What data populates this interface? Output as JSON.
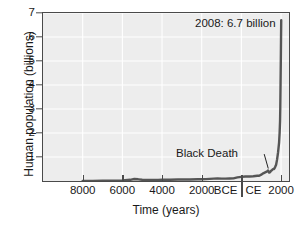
{
  "chart_data": {
    "type": "line",
    "title": "",
    "xlabel": "Time (years)",
    "ylabel": "Human population (billions)",
    "xlim": [
      -10000,
      2400
    ],
    "ylim": [
      0,
      7
    ],
    "grid": true,
    "legend": null,
    "y_ticks": [
      1,
      2,
      3,
      4,
      5,
      6,
      7
    ],
    "y_tick_labels": [
      "1",
      "2",
      "3",
      "4",
      "5",
      "6",
      "7"
    ],
    "x_ticks": [
      -8000,
      -6000,
      -4000,
      -2000,
      0,
      2000
    ],
    "x_tick_labels": [
      "8000",
      "6000",
      "4000",
      "2000",
      "",
      "2000"
    ],
    "era_labels": {
      "bce": "BCE",
      "ce": "CE",
      "divider_year": 0
    },
    "series": [
      {
        "name": "Human population",
        "color": "#555555",
        "x": [
          -8000,
          -7500,
          -7000,
          -6500,
          -6000,
          -5600,
          -5400,
          -5200,
          -5000,
          -4600,
          -4200,
          -4000,
          -3600,
          -3200,
          -3000,
          -2600,
          -2200,
          -2000,
          -1800,
          -1600,
          -1400,
          -1200,
          -1000,
          -800,
          -600,
          -400,
          -200,
          0,
          200,
          400,
          600,
          700,
          800,
          900,
          1000,
          1100,
          1200,
          1300,
          1340,
          1400,
          1450,
          1500,
          1550,
          1600,
          1650,
          1700,
          1750,
          1800,
          1850,
          1900,
          1927,
          1950,
          1960,
          1974,
          1987,
          1999,
          2008
        ],
        "y": [
          0.005,
          0.007,
          0.01,
          0.014,
          0.02,
          0.05,
          0.085,
          0.07,
          0.05,
          0.045,
          0.045,
          0.05,
          0.055,
          0.06,
          0.06,
          0.065,
          0.07,
          0.075,
          0.08,
          0.09,
          0.1,
          0.105,
          0.1,
          0.1,
          0.105,
          0.11,
          0.15,
          0.17,
          0.19,
          0.19,
          0.2,
          0.21,
          0.22,
          0.22,
          0.265,
          0.32,
          0.36,
          0.4,
          0.44,
          0.35,
          0.37,
          0.43,
          0.46,
          0.5,
          0.5,
          0.58,
          0.68,
          0.9,
          1.2,
          1.6,
          2.0,
          2.5,
          3.0,
          4.0,
          5.0,
          6.0,
          6.7
        ]
      }
    ],
    "annotations": [
      {
        "id": "peak",
        "text": "2008: 6.7 billion",
        "year": 2008,
        "value": 6.7
      },
      {
        "id": "black-death",
        "text": "Black Death",
        "year": 1350,
        "value": 0.37
      }
    ]
  }
}
